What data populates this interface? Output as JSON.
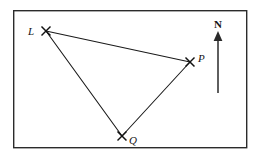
{
  "figure": {
    "type": "bearings-triangle-diagram",
    "background_color": "#ffffff",
    "ink_color": "#1a1a1a",
    "frame": {
      "name": "diagram-border",
      "x": 13,
      "y": 10,
      "width": 234,
      "height": 138,
      "stroke_color": "#2b2b2b"
    },
    "points": [
      {
        "id": "L",
        "label": "L",
        "x": 46,
        "y": 31,
        "label_x": 31,
        "label_y": 35,
        "marker": "cross-x"
      },
      {
        "id": "P",
        "label": "P",
        "x": 190,
        "y": 62,
        "label_x": 196,
        "label_y": 62,
        "marker": "cross-x"
      },
      {
        "id": "Q",
        "label": "Q",
        "x": 122,
        "y": 136,
        "label_x": 128,
        "label_y": 144,
        "marker": "cross-x"
      }
    ],
    "segments": [
      {
        "id": "LP",
        "from": "L",
        "to": "P",
        "x1": 46,
        "y1": 31,
        "x2": 190,
        "y2": 62
      },
      {
        "id": "LQ",
        "from": "L",
        "to": "Q",
        "x1": 46,
        "y1": 31,
        "x2": 122,
        "y2": 136
      },
      {
        "id": "QP",
        "from": "Q",
        "to": "P",
        "x1": 122,
        "y1": 136,
        "x2": 190,
        "y2": 62
      }
    ],
    "compass": {
      "label": "N",
      "label_x": 218,
      "label_y": 28,
      "shaft_x": 218,
      "shaft_top": 38,
      "shaft_bottom": 93,
      "arrow_tip_y": 32,
      "arrow_half_width": 4,
      "color": "#2a2a2a"
    }
  }
}
